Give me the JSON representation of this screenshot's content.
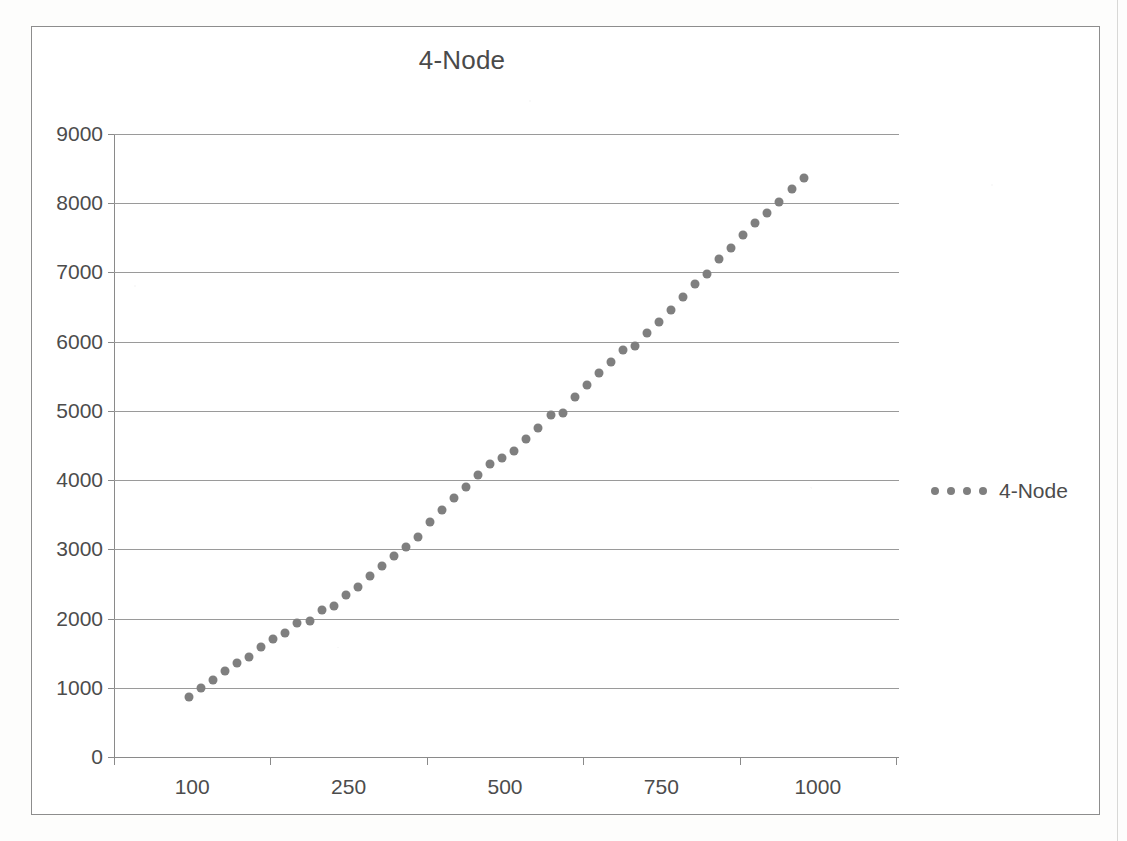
{
  "chart_data": {
    "type": "scatter",
    "title": "4-Node",
    "xlabel": "",
    "ylabel": "",
    "ylim": [
      0,
      9000
    ],
    "y_ticks": [
      0,
      1000,
      2000,
      3000,
      4000,
      5000,
      6000,
      7000,
      8000,
      9000
    ],
    "y_tick_labels": [
      "0",
      "1000",
      "2000",
      "3000",
      "4000",
      "5000",
      "6000",
      "7000",
      "8000",
      "9000"
    ],
    "x_tick_labels": [
      "100",
      "250",
      "500",
      "750",
      "1000"
    ],
    "grid": true,
    "legend_position": "right",
    "series": [
      {
        "name": "4-Node",
        "marker": "circle",
        "color": "#7f7f7f",
        "values": [
          870,
          1000,
          1110,
          1240,
          1360,
          1450,
          1590,
          1700,
          1790,
          1930,
          1960,
          2120,
          2180,
          2340,
          2450,
          2620,
          2760,
          2900,
          3030,
          3180,
          3390,
          3570,
          3740,
          3900,
          4070,
          4230,
          4320,
          4420,
          4600,
          4760,
          4940,
          4970,
          5200,
          5380,
          5550,
          5710,
          5880,
          5940,
          6130,
          6280,
          6460,
          6650,
          6830,
          6980,
          7200,
          7360,
          7540,
          7710,
          7860,
          8020,
          8200,
          8370
        ]
      }
    ]
  },
  "legend": {
    "label": "4-Node",
    "dot_count": 4,
    "marker_icon": "dotted-line-marker-icon"
  },
  "colors": {
    "marker": "#7f7f7f",
    "gridline": "#9a9a9a",
    "axis": "#8a8a8a",
    "text": "#4c4c4c",
    "frame": "#8d8d8d"
  }
}
